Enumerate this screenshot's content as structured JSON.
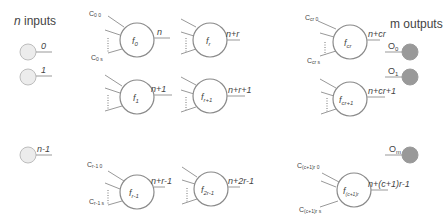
{
  "title_inputs": "n inputs",
  "title_inputs_italic": "n",
  "title_inputs_rest": " inputs",
  "title_outputs": "m outputs",
  "colors": {
    "input_fill": "#ececec",
    "output_fill": "#999999",
    "stroke": "#8a8a8a"
  },
  "inputs": [
    {
      "label": "0"
    },
    {
      "label": "1"
    },
    {
      "label": "n-1"
    }
  ],
  "outputs": [
    {
      "label": "O",
      "sub": "0"
    },
    {
      "label": "O",
      "sub": "1"
    },
    {
      "label": "O",
      "sub": "m"
    }
  ],
  "nodes": [
    {
      "f": "f",
      "sub": "0",
      "out": "n",
      "c_top": "C",
      "c_top_sub": "0 0",
      "c_bot": "C",
      "c_bot_sub": "0 s"
    },
    {
      "f": "f",
      "sub": "1",
      "out": "n+1"
    },
    {
      "f": "f",
      "sub": "r-1",
      "out": "n+r-1",
      "c_top": "C",
      "c_top_sub": "r-1 0",
      "c_bot": "C",
      "c_bot_sub": "r-1 s"
    },
    {
      "f": "f",
      "sub": "r",
      "out": "n+r"
    },
    {
      "f": "f",
      "sub": "r+1",
      "out": "n+r+1"
    },
    {
      "f": "f",
      "sub": "2r-1",
      "out": "n+2r-1"
    },
    {
      "f": "f",
      "sub": "cr",
      "out": "n+cr",
      "c_top": "C",
      "c_top_sub": "cr 0",
      "c_bot": "C",
      "c_bot_sub": "cr s"
    },
    {
      "f": "f",
      "sub": "cr+1",
      "out": "n+cr+1"
    },
    {
      "f": "f",
      "sub": "(c+1)r",
      "out": "n+(c+1)r-1",
      "c_top": "C",
      "c_top_sub": "(c+1)r 0",
      "c_bot": "C",
      "c_bot_sub": "(c+1)r s"
    }
  ]
}
